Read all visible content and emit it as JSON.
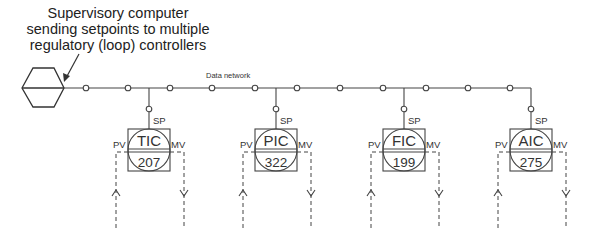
{
  "caption": {
    "lines": [
      "Supervisory computer",
      "sending setpoints to multiple",
      "regulatory (loop) controllers"
    ]
  },
  "network": {
    "label": "Data network",
    "line_color": "#444444"
  },
  "controllers": [
    {
      "tag": "TIC",
      "number": "207",
      "sp_label": "SP",
      "pv_label": "PV",
      "mv_label": "MV"
    },
    {
      "tag": "PIC",
      "number": "322",
      "sp_label": "SP",
      "pv_label": "PV",
      "mv_label": "MV"
    },
    {
      "tag": "FIC",
      "number": "199",
      "sp_label": "SP",
      "pv_label": "PV",
      "mv_label": "MV"
    },
    {
      "tag": "AIC",
      "number": "275",
      "sp_label": "SP",
      "pv_label": "PV",
      "mv_label": "MV"
    }
  ]
}
